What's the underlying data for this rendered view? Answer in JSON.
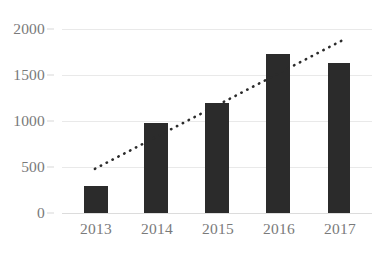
{
  "chart_data": {
    "type": "bar",
    "title": "",
    "subtitle": "",
    "xlabel": "",
    "ylabel": "",
    "categories": [
      "2013",
      "2014",
      "2015",
      "2016",
      "2017"
    ],
    "values": [
      290,
      975,
      1200,
      1730,
      1630
    ],
    "series": [
      {
        "name": "Value",
        "values": [
          290,
          975,
          1200,
          1730,
          1630
        ],
        "color": "#2b2b2b",
        "type": "bar"
      },
      {
        "name": "Trendline",
        "type": "line",
        "style": "dotted",
        "color": "#2b2b2b",
        "start": {
          "x": "2013",
          "y": 480
        },
        "end": {
          "x": "2017",
          "y": 1880
        }
      }
    ],
    "ylim": [
      0,
      2000
    ],
    "yticks": [
      0,
      500,
      1000,
      1500,
      2000
    ],
    "ytick_labels": [
      "0",
      "500",
      "1000",
      "1500",
      "2000"
    ],
    "grid": true,
    "grid_axis": "y",
    "legend": false,
    "legend_position": "none",
    "annotations": []
  },
  "axes": {
    "y": {
      "ticks": [
        {
          "label": "2000",
          "value": 2000
        },
        {
          "label": "1500",
          "value": 1500
        },
        {
          "label": "1000",
          "value": 1000
        },
        {
          "label": "500",
          "value": 500
        },
        {
          "label": "0",
          "value": 0
        }
      ]
    },
    "x": {
      "ticks": [
        {
          "label": "2013"
        },
        {
          "label": "2014"
        },
        {
          "label": "2015"
        },
        {
          "label": "2016"
        },
        {
          "label": "2017"
        }
      ]
    }
  },
  "colors": {
    "bar": "#2b2b2b",
    "trendline": "#2b2b2b",
    "gridline": "#e9e9e9",
    "baseline": "#dcdcdc",
    "tick_text": "#7a7a7a",
    "background": "#ffffff"
  }
}
